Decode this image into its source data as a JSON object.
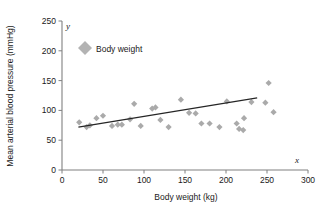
{
  "chart_data": {
    "type": "scatter",
    "title": "",
    "xlabel": "Body weight (kg)",
    "ylabel": "Mean arterial blood pressure (mmHg)",
    "x_axis_letter": "x",
    "y_axis_letter": "y",
    "xlim": [
      0,
      300
    ],
    "ylim": [
      0,
      250
    ],
    "xticks": [
      0,
      50,
      100,
      150,
      200,
      250,
      300
    ],
    "yticks": [
      0,
      50,
      100,
      150,
      200,
      250
    ],
    "xtick_labels": [
      "0",
      "50",
      "100",
      "150",
      "200",
      "250",
      "300"
    ],
    "ytick_labels": [
      "0",
      "50",
      "100",
      "150",
      "200",
      "250"
    ],
    "grid": false,
    "legend_position": "upper-left-inside",
    "legend": [
      {
        "label": "Body weight",
        "marker": "diamond",
        "color": "#b3b3b3"
      }
    ],
    "series": [
      {
        "name": "Body weight",
        "marker": "diamond",
        "color": "#aaaaaa",
        "points": [
          {
            "x": 21,
            "y": 80
          },
          {
            "x": 30,
            "y": 72
          },
          {
            "x": 34,
            "y": 75
          },
          {
            "x": 42,
            "y": 87
          },
          {
            "x": 50,
            "y": 91
          },
          {
            "x": 61,
            "y": 74
          },
          {
            "x": 68,
            "y": 76
          },
          {
            "x": 73,
            "y": 76
          },
          {
            "x": 83,
            "y": 85
          },
          {
            "x": 88,
            "y": 111
          },
          {
            "x": 96,
            "y": 74
          },
          {
            "x": 110,
            "y": 103
          },
          {
            "x": 114,
            "y": 105
          },
          {
            "x": 120,
            "y": 84
          },
          {
            "x": 130,
            "y": 72
          },
          {
            "x": 145,
            "y": 118
          },
          {
            "x": 155,
            "y": 96
          },
          {
            "x": 163,
            "y": 95
          },
          {
            "x": 170,
            "y": 78
          },
          {
            "x": 180,
            "y": 78
          },
          {
            "x": 192,
            "y": 72
          },
          {
            "x": 201,
            "y": 115
          },
          {
            "x": 213,
            "y": 78
          },
          {
            "x": 222,
            "y": 87
          },
          {
            "x": 216,
            "y": 69
          },
          {
            "x": 221,
            "y": 67
          },
          {
            "x": 231,
            "y": 114
          },
          {
            "x": 248,
            "y": 113
          },
          {
            "x": 252,
            "y": 146
          },
          {
            "x": 258,
            "y": 97
          }
        ]
      }
    ],
    "trend_line": {
      "name": "linear fit",
      "color": "#262626",
      "x_start": 20,
      "y_start": 72,
      "x_end": 238,
      "y_end": 121
    }
  }
}
